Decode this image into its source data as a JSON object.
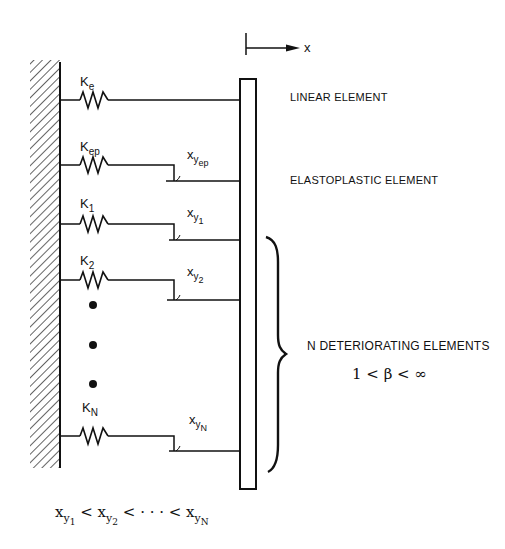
{
  "diagram": {
    "axis_label": "x",
    "elements": [
      {
        "spring_label": "K",
        "spring_sub": "e",
        "description": "LINEAR ELEMENT"
      },
      {
        "spring_label": "K",
        "spring_sub": "ep",
        "slip_label": "x",
        "slip_sub": "y",
        "slip_subsub": "ep",
        "description": "ELASTOPLASTIC ELEMENT"
      },
      {
        "spring_label": "K",
        "spring_sub": "1",
        "slip_label": "x",
        "slip_sub": "y",
        "slip_subsub": "1"
      },
      {
        "spring_label": "K",
        "spring_sub": "2",
        "slip_label": "x",
        "slip_sub": "y",
        "slip_subsub": "2"
      },
      {
        "spring_label": "K",
        "spring_sub": "N",
        "slip_label": "x",
        "slip_sub": "y",
        "slip_subsub": "N"
      }
    ],
    "group_label": "N DETERIORATING ELEMENTS",
    "beta_range": "1 < β < ∞",
    "ordering": {
      "x": "x",
      "y": "y",
      "s1": "1",
      "s2": "2",
      "sN": "N",
      "lt": "<",
      "dots": "· · ·"
    }
  }
}
